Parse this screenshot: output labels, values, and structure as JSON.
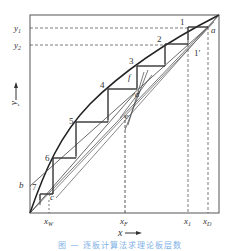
{
  "figure": {
    "type": "McCabe-Thiele stepwise construction diagram",
    "axes": {
      "x_label": "x",
      "y_label": "y"
    },
    "x_ticks": [
      {
        "label": "x",
        "sub": "W",
        "x": 49
      },
      {
        "label": "x",
        "sub": "F",
        "x": 125
      },
      {
        "label": "x",
        "sub": "1",
        "x": 188
      },
      {
        "label": "x",
        "sub": "D",
        "x": 208
      }
    ],
    "y_ticks": [
      {
        "label": "y",
        "sub": "1",
        "y": 28
      },
      {
        "label": "y",
        "sub": "2",
        "y": 45
      }
    ],
    "stage_labels": [
      "1",
      "2",
      "3",
      "4",
      "5",
      "6",
      "7",
      "1'"
    ],
    "point_labels": [
      "a",
      "b",
      "c",
      "d",
      "e",
      "f"
    ],
    "caption": "图 — 逐板计算法求理论板层数",
    "colors": {
      "line": "#333333",
      "caption": "#7fb2e6"
    }
  }
}
